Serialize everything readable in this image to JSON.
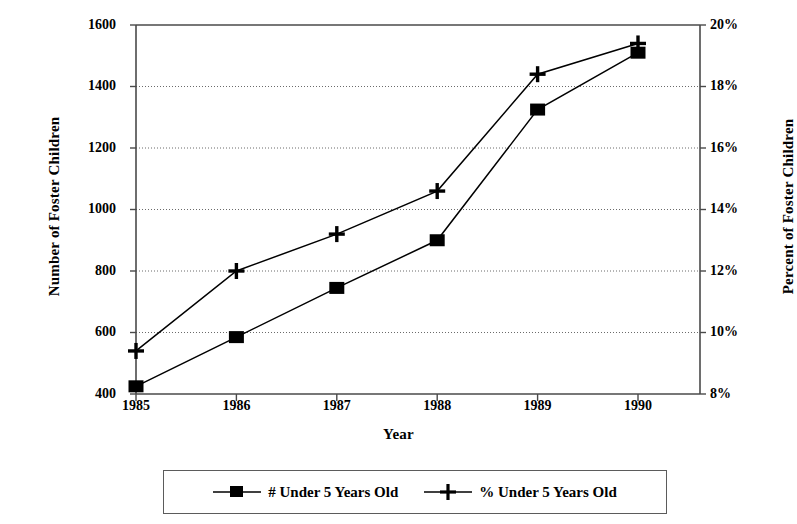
{
  "chart_data": {
    "type": "line",
    "title": "",
    "xlabel": "Year",
    "categories": [
      "1985",
      "1986",
      "1987",
      "1988",
      "1989",
      "1990"
    ],
    "grid": true,
    "legend_position": "bottom",
    "axes": {
      "left": {
        "label": "Number of Foster Children",
        "ticks": [
          "1600",
          "1400",
          "1200",
          "1000",
          "800",
          "600",
          "400"
        ],
        "tick_values": [
          1600,
          1400,
          1200,
          1000,
          800,
          600,
          400
        ],
        "ylim": [
          400,
          1600
        ]
      },
      "right": {
        "label": "Percent of Foster Children",
        "ticks": [
          "20%",
          "18%",
          "16%",
          "14%",
          "12%",
          "10%",
          "8%"
        ],
        "tick_values": [
          20,
          18,
          16,
          14,
          12,
          10,
          8
        ],
        "ylim": [
          8,
          20
        ]
      }
    },
    "series": [
      {
        "name": "# Under 5 Years Old",
        "axis": "left",
        "marker": "square",
        "color": "#000000",
        "values": [
          425,
          585,
          745,
          900,
          1325,
          1510
        ]
      },
      {
        "name": "% Under 5 Years Old",
        "axis": "right",
        "marker": "plus",
        "color": "#000000",
        "values": [
          9.4,
          12.0,
          13.2,
          14.6,
          18.4,
          19.4
        ]
      }
    ]
  },
  "legend": {
    "items": [
      {
        "label": "# Under 5 Years Old",
        "marker": "square-marker"
      },
      {
        "label": "% Under 5 Years Old",
        "marker": "plus-marker"
      }
    ]
  }
}
